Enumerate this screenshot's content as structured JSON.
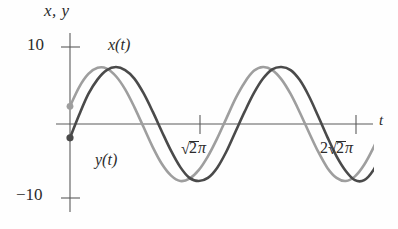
{
  "figure": {
    "axis_title": "x, y",
    "t_axis_label": "t",
    "background_color": "#fefefe"
  },
  "axes": {
    "y_tick_positive": "10",
    "y_tick_negative": "−10",
    "x_tick_1_coef": "",
    "x_tick_1_radicand": "2",
    "x_tick_1_pi": "π",
    "x_tick_2_coef": "2",
    "x_tick_2_radicand": "2",
    "x_tick_2_pi": "π",
    "radical_glyph": "√"
  },
  "curves": {
    "x_label": "x(t)",
    "y_label": "y(t)",
    "x_color": "#4a4a4a",
    "y_color": "#9e9e9e"
  },
  "chart_data": {
    "type": "line",
    "title": "",
    "xlabel": "t",
    "ylabel": "x, y",
    "ylim": [
      -12,
      12
    ],
    "xlim": [
      0,
      3.45
    ],
    "grid": false,
    "legend": "inline-annotations",
    "y_ticks": [
      10,
      -10
    ],
    "y_tick_labels": [
      "10",
      "−10"
    ],
    "x_ticks": [
      1.4142,
      2.8284
    ],
    "x_tick_labels": [
      "√2 π",
      "2√2 π"
    ],
    "x_tick_units": "multiples of π",
    "note": "x in units of pi; ticks at sqrt(2)*pi and 2*sqrt(2)*pi",
    "series": [
      {
        "name": "x(t)",
        "color": "#4a4a4a",
        "start_value": -1.8,
        "amplitude": 7.4,
        "period_pi": 1.4142,
        "phase_deg": -14,
        "marker_at_origin": true,
        "x": [
          0.0,
          0.1,
          0.2,
          0.3,
          0.4,
          0.5,
          0.6,
          0.7,
          0.8,
          0.9,
          1.0,
          1.1,
          1.2,
          1.3,
          1.4,
          1.5,
          1.6,
          1.7,
          1.8,
          1.9,
          2.0,
          2.1,
          2.2,
          2.3,
          2.4,
          2.5,
          2.6,
          2.7,
          2.8,
          2.9,
          3.0,
          3.1,
          3.2,
          3.3,
          3.4
        ],
        "y": [
          -1.8,
          1.2,
          3.9,
          5.8,
          7.0,
          7.4,
          7.0,
          5.9,
          4.0,
          1.6,
          -1.0,
          -3.5,
          -5.6,
          -7.0,
          -7.4,
          -7.0,
          -5.7,
          -3.6,
          -1.0,
          1.6,
          4.0,
          5.9,
          7.1,
          7.4,
          7.0,
          5.7,
          3.6,
          1.0,
          -1.7,
          -4.2,
          -6.1,
          -7.3,
          -7.3,
          -6.0,
          -3.6
        ]
      },
      {
        "name": "y(t)",
        "color": "#9e9e9e",
        "start_value": 2.3,
        "amplitude": 7.4,
        "period_pi": 1.4142,
        "phase_deg": 18,
        "marker_at_origin": true,
        "x": [
          0.0,
          0.1,
          0.2,
          0.3,
          0.4,
          0.5,
          0.6,
          0.7,
          0.8,
          0.9,
          1.0,
          1.1,
          1.2,
          1.3,
          1.4,
          1.5,
          1.6,
          1.7,
          1.8,
          1.9,
          2.0,
          2.1,
          2.2,
          2.3,
          2.4,
          2.5,
          2.6,
          2.7,
          2.8,
          2.9,
          3.0,
          3.1,
          3.2,
          3.3,
          3.4
        ],
        "y": [
          2.3,
          4.8,
          6.5,
          7.3,
          7.2,
          6.2,
          4.5,
          2.2,
          -0.4,
          -3.0,
          -5.2,
          -6.7,
          -7.4,
          -7.1,
          -6.0,
          -4.2,
          -1.9,
          0.7,
          3.3,
          5.4,
          6.9,
          7.4,
          7.0,
          5.8,
          3.9,
          1.5,
          -1.1,
          -3.6,
          -5.7,
          -7.0,
          -7.4,
          -6.8,
          -5.3,
          -3.1,
          -0.5
        ]
      }
    ]
  }
}
